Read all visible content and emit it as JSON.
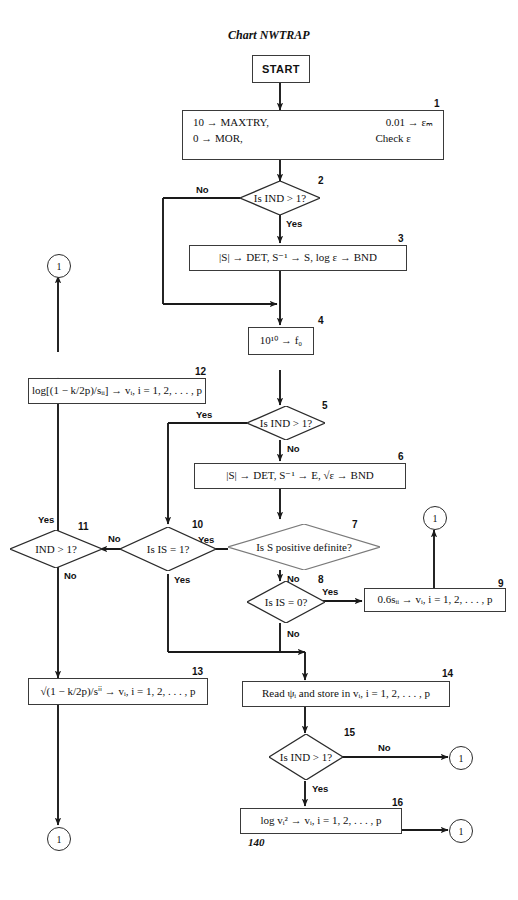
{
  "chart": {
    "title": "Chart NWTRAP",
    "page_number": "140"
  },
  "nodes": {
    "start": {
      "label": "START",
      "type": "terminal"
    },
    "b1": {
      "num": "1",
      "line1_left": "10 → MAXTRY,",
      "line1_right": "0.01 → εₘ",
      "line2_left": "0 → MOR,",
      "line2_right": "Check ε"
    },
    "d2": {
      "num": "2",
      "label": "Is IND > 1?",
      "yes": "Yes",
      "no": "No"
    },
    "b3": {
      "num": "3",
      "label": "|S| → DET, S⁻¹ → S, log ε → BND"
    },
    "b4": {
      "num": "4",
      "label": "10¹⁰ → f₀"
    },
    "d5": {
      "num": "5",
      "label": "Is IND > 1?",
      "yes": "Yes",
      "no": "No"
    },
    "b6": {
      "num": "6",
      "label": "|S| → DET, S⁻¹ → E, √ε → BND"
    },
    "d7": {
      "num": "7",
      "label": "Is S positive definite?",
      "yes": "Yes",
      "no": "No"
    },
    "d8": {
      "num": "8",
      "label": "Is IS = 0?",
      "yes": "Yes",
      "no": "No"
    },
    "b9": {
      "num": "9",
      "label": "0.6sᵢᵢ → vᵢ, i = 1, 2, . . . , p"
    },
    "d10": {
      "num": "10",
      "label": "Is IS = 1?",
      "yes": "Yes",
      "no": "No"
    },
    "d11": {
      "num": "11",
      "label": "IND > 1?",
      "yes": "Yes",
      "no": "No"
    },
    "b12": {
      "num": "12",
      "label": "log[(1 − k/2p)/sᵢᵢ] → vᵢ, i = 1, 2, . . . , p"
    },
    "b13": {
      "num": "13",
      "label": "√(1 − k/2p)/sⁱⁱ → vᵢ, i = 1, 2, . . . , p"
    },
    "b14": {
      "num": "14",
      "label": "Read ψᵢ and store in vᵢ, i = 1, 2, . . . , p"
    },
    "d15": {
      "num": "15",
      "label": "Is IND > 1?",
      "yes": "Yes",
      "no": "No"
    },
    "b16": {
      "num": "16",
      "label": "log vᵢ² → vᵢ, i = 1, 2, . . . , p"
    }
  },
  "connectors": {
    "c_left_top": "1",
    "c_right_mid": "1",
    "c_left_bottom": "1",
    "c_right_d15": "1",
    "c_right_b16": "1"
  },
  "colors": {
    "ink": "#111111",
    "line": "#2b2b2b",
    "box_border": "#3a3a3a",
    "paper": "#ffffff"
  }
}
